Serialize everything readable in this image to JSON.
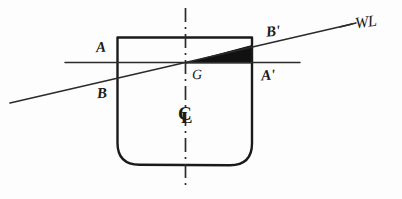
{
  "figure": {
    "background_color": "#fdfdfd",
    "ink_color": "#1a1a1a",
    "wedge_fill": "#111111"
  },
  "labels": {
    "a": "A",
    "b": "B",
    "a_prime": "A'",
    "b_prime": "B'",
    "g": "G",
    "waterline": "WL",
    "centerline_c": "C",
    "centerline_l": "L"
  },
  "geometry": {
    "hull": {
      "left_x": 117,
      "right_x": 252,
      "top_y": 37,
      "bottom_y": 165,
      "bilge_radius": 22
    },
    "upright_waterline": {
      "label_left": "A",
      "label_right": "A'",
      "x1": 65,
      "y1": 62,
      "x2": 300,
      "y2": 62
    },
    "inclined_waterline": {
      "label_left": "B",
      "label_right": "B'",
      "x1": 10,
      "y1": 103,
      "x2": 352,
      "y2": 24,
      "heel_direction": "starboard"
    },
    "centerline": {
      "x": 185,
      "y_top": 8,
      "y_bottom": 190,
      "style": "dash-dot"
    },
    "centroid_g": {
      "x": 185,
      "y": 62
    },
    "emerged_wedge": {
      "fill": "solid-black",
      "vertices": [
        [
          185,
          62
        ],
        [
          252,
          62
        ],
        [
          252,
          46
        ]
      ]
    }
  }
}
